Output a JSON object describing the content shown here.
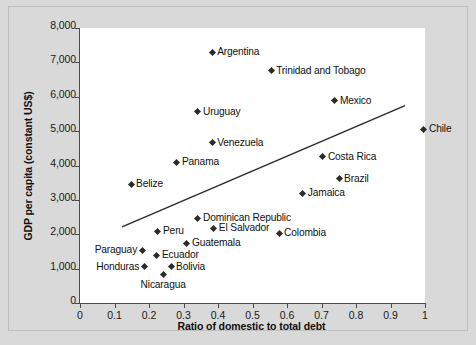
{
  "chart_data": {
    "type": "scatter",
    "title": "",
    "xlabel": "Ratio of domestic to total debt",
    "ylabel": "GDP per capita (constant US$)",
    "xlim": [
      0,
      1
    ],
    "ylim": [
      0,
      8000
    ],
    "xticks": [
      "0",
      "0.1",
      "0.2",
      "0.3",
      "0.4",
      "0.5",
      "0.6",
      "0.7",
      "0.8",
      "0.9",
      "1"
    ],
    "xtick_values": [
      0,
      0.1,
      0.2,
      0.3,
      0.4,
      0.5,
      0.6,
      0.7,
      0.8,
      0.9,
      1
    ],
    "yticks": [
      "0",
      "1,000",
      "2,000",
      "3,000",
      "4,000",
      "5,000",
      "6,000",
      "7,000",
      "8,000"
    ],
    "ytick_values": [
      0,
      1000,
      2000,
      3000,
      4000,
      5000,
      6000,
      7000,
      8000
    ],
    "grid": false,
    "legend": "none",
    "points": [
      {
        "name": "Argentina",
        "x": 0.383,
        "y": 7300,
        "label_pos": "right"
      },
      {
        "name": "Trinidad and Tobago",
        "x": 0.554,
        "y": 6750,
        "label_pos": "right"
      },
      {
        "name": "Mexico",
        "x": 0.739,
        "y": 5880,
        "label_pos": "right"
      },
      {
        "name": "Uruguay",
        "x": 0.342,
        "y": 5560,
        "label_pos": "right"
      },
      {
        "name": "Chile",
        "x": 0.997,
        "y": 5060,
        "label_pos": "right"
      },
      {
        "name": "Venezuela",
        "x": 0.383,
        "y": 4660,
        "label_pos": "right"
      },
      {
        "name": "Panama",
        "x": 0.281,
        "y": 4100,
        "label_pos": "right"
      },
      {
        "name": "Costa Rica",
        "x": 0.704,
        "y": 4250,
        "label_pos": "right"
      },
      {
        "name": "Brazil",
        "x": 0.751,
        "y": 3610,
        "label_pos": "right"
      },
      {
        "name": "Belize",
        "x": 0.148,
        "y": 3460,
        "label_pos": "right"
      },
      {
        "name": "Jamaica",
        "x": 0.646,
        "y": 3200,
        "label_pos": "right"
      },
      {
        "name": "Dominican Republic",
        "x": 0.342,
        "y": 2470,
        "label_pos": "right"
      },
      {
        "name": "El Salvador",
        "x": 0.388,
        "y": 2180,
        "label_pos": "right"
      },
      {
        "name": "Peru",
        "x": 0.226,
        "y": 2090,
        "label_pos": "right"
      },
      {
        "name": "Colombia",
        "x": 0.577,
        "y": 2035,
        "label_pos": "right"
      },
      {
        "name": "Guatemala",
        "x": 0.31,
        "y": 1745,
        "label_pos": "right"
      },
      {
        "name": "Paraguay",
        "x": 0.18,
        "y": 1540,
        "label_pos": "left"
      },
      {
        "name": "Ecuador",
        "x": 0.223,
        "y": 1395,
        "label_pos": "right"
      },
      {
        "name": "Bolivia",
        "x": 0.264,
        "y": 1050,
        "label_pos": "right"
      },
      {
        "name": "Honduras",
        "x": 0.186,
        "y": 1050,
        "label_pos": "left"
      },
      {
        "name": "Nicaragua",
        "x": 0.241,
        "y": 815,
        "label_pos": "below"
      }
    ],
    "trendline": {
      "x0": 0.122,
      "y0": 2215,
      "x1": 0.942,
      "y1": 5740
    }
  }
}
